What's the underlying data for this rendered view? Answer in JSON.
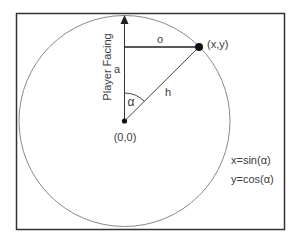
{
  "diagram": {
    "colors": {
      "frame": "#333333",
      "circle": "#888888",
      "lines": "#222222",
      "text": "#3a3a3a",
      "background": "#ffffff"
    },
    "labels": {
      "axis": "Player Facing",
      "opposite": "o",
      "adjacent": "a",
      "hypotenuse": "h",
      "angle": "α",
      "origin": "(0,0)",
      "point": "(x,y)"
    },
    "equations": [
      "x=sin(α)",
      "y=cos(α)"
    ]
  }
}
